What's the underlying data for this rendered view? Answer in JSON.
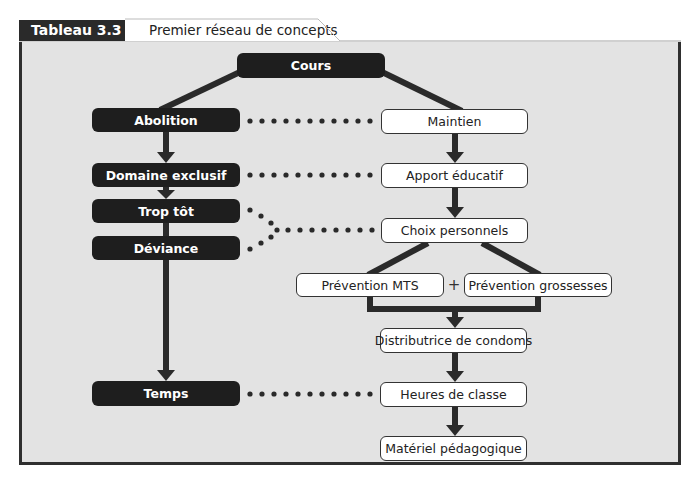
{
  "header": {
    "table_label": "Tableau 3.3",
    "title": "Premier réseau de concepts"
  },
  "diagram": {
    "root": {
      "label": "Cours"
    },
    "left_column": [
      {
        "label": "Abolition"
      },
      {
        "label": "Domaine exclusif"
      },
      {
        "label": "Trop tôt"
      },
      {
        "label": "Déviance"
      },
      {
        "label": "Temps"
      }
    ],
    "right_column": [
      {
        "label": "Maintien"
      },
      {
        "label": "Apport éducatif"
      },
      {
        "label": "Choix personnels"
      },
      {
        "label": "Prévention MTS"
      },
      {
        "label": "Prévention grossesses"
      },
      {
        "label": "Distributrice de condoms"
      },
      {
        "label": "Heures de classe"
      },
      {
        "label": "Matériel pédagogique"
      }
    ],
    "plus_sign": "+",
    "colors": {
      "dark_node": "#1e1e1e",
      "light_node": "#ffffff",
      "background": "#e3e3e3",
      "lines": "#2a2a2a"
    }
  }
}
